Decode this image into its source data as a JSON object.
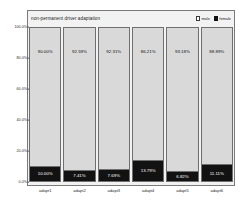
{
  "chart_data": {
    "type": "bar",
    "subtype": "stacked-100-percent",
    "title": "non-permanent driver adaptation",
    "xlabel": "",
    "ylabel": "",
    "ylim": [
      0,
      100
    ],
    "grid": false,
    "legend_position": "top-right",
    "categories": [
      "adapt1",
      "adapt2",
      "adapt3",
      "adapt4",
      "adapt5",
      "adapt6"
    ],
    "series": [
      {
        "name": "male",
        "color": "#d9d9d9",
        "values": [
          90.0,
          92.59,
          92.31,
          86.21,
          93.18,
          88.89
        ],
        "labels": [
          "90.00%",
          "92.59%",
          "92.31%",
          "86.21%",
          "93.18%",
          "88.89%"
        ]
      },
      {
        "name": "female",
        "color": "#121212",
        "values": [
          10.0,
          7.41,
          7.69,
          13.79,
          6.82,
          11.11
        ],
        "labels": [
          "10.00%",
          "7.41%",
          "7.69%",
          "13.79%",
          "6.82%",
          "11.11%"
        ]
      }
    ],
    "yticks": [
      {
        "value": 100,
        "label": "100.0%"
      },
      {
        "value": 80,
        "label": "80.0%"
      },
      {
        "value": 60,
        "label": "60.0%"
      },
      {
        "value": 40,
        "label": "40.0%"
      },
      {
        "value": 20,
        "label": "20.0%"
      },
      {
        "value": 0,
        "label": "0.0%"
      }
    ]
  },
  "legend": {
    "items": [
      {
        "label": "male",
        "swatch": "swatch-male-white"
      },
      {
        "label": "female",
        "swatch": "swatch-female-black"
      }
    ]
  },
  "colors": {
    "male_fill": "#d9d9d9",
    "female_fill": "#121212",
    "frame": "#7a7a7a",
    "background": "#f2f2f2",
    "text": "#1c1c1c"
  }
}
